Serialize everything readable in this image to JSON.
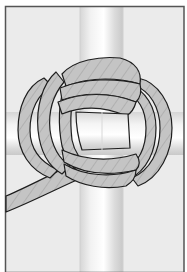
{
  "figure": {
    "title": "Monkey's fist knot",
    "colors": {
      "background": "#ebebeb",
      "frame": "#555555",
      "rope_fill": "#c4c4c4",
      "rope_outline": "#1e1e1e",
      "rope_twist": "#9a9a9a",
      "bar_light": "#fafafa",
      "bar_dark": "#cfcfcf"
    }
  }
}
